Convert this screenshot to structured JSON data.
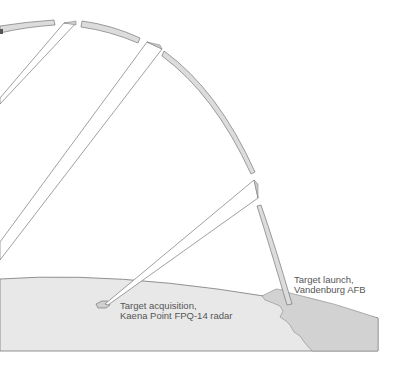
{
  "diagram": {
    "labels": {
      "acquisition": {
        "line1": "Target acquisition,",
        "line2": "Kaena Point FPQ-14 radar"
      },
      "launch": {
        "line1": "Target launch,",
        "line2": "Vandenburg AFB"
      }
    },
    "elements": {
      "trajectory": "ballistic-trajectory-arc",
      "earth": "earth-surface",
      "coast": "california-coastline",
      "island": "oahu-island",
      "beams": [
        "radar-beam-acquisition",
        "radar-beam-upper",
        "radar-beam-left"
      ]
    },
    "colors": {
      "earth_fill": "#e8e8e8",
      "land_fill": "#d2d2d2",
      "trajectory_fill": "#dcdcdc",
      "outline": "#666666",
      "beam_fill": "#ffffff",
      "text": "#555555"
    }
  }
}
